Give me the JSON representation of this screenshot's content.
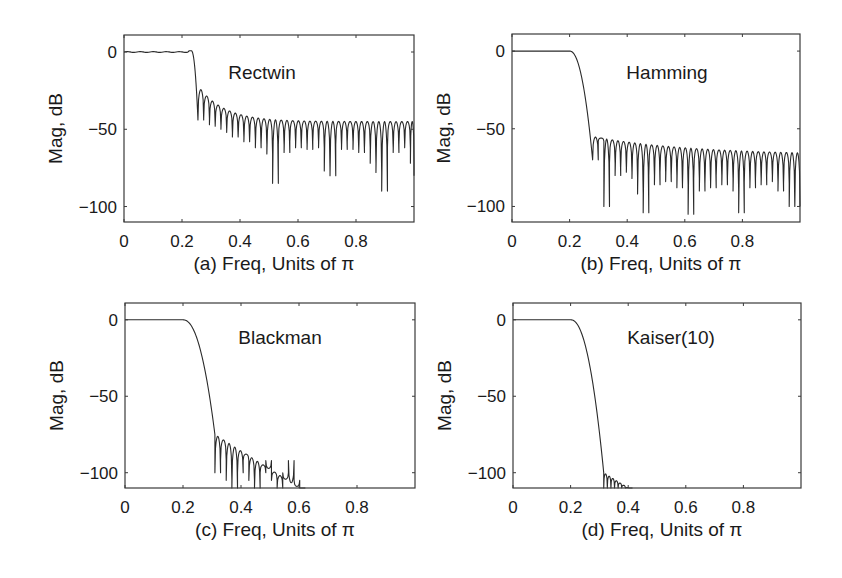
{
  "figure": {
    "background": "#ffffff",
    "line_color": "#2a2a2a",
    "axis_color": "#3a3a3a"
  },
  "chart_data": [
    {
      "type": "line",
      "panel": "a",
      "title": "Rectwin",
      "xlabel": "(a) Freq, Units of π",
      "ylabel": "Mag, dB",
      "xlim": [
        0,
        1
      ],
      "ylim": [
        -110,
        11
      ],
      "xticks": [
        0,
        0.2,
        0.4,
        0.6,
        0.8
      ],
      "xtick_labels": [
        "0",
        "0.2",
        "0.4",
        "0.6",
        "0.8"
      ],
      "yticks": [
        0,
        -50,
        -100
      ],
      "ytick_labels": [
        "0",
        "−50",
        "−100"
      ],
      "grid": false,
      "box": {
        "left": 124,
        "top": 35,
        "right": 414,
        "bottom": 222
      },
      "title_pos": {
        "x": 262,
        "y": 79
      },
      "passband": {
        "end": 0.23,
        "level": 0,
        "ripple_peak_x": 0.225,
        "ripple_peak": 0.8
      },
      "transition": {
        "start": 0.232,
        "end": 0.255
      },
      "stopband": {
        "start": 0.255,
        "first_sidelobe_db": -22,
        "asymptote_db": -45,
        "decay": 0.09,
        "lobe_width": 0.0198,
        "null_depth_db": [
          -44,
          -43,
          -47,
          -48,
          -50,
          -52,
          -55,
          -55,
          -58,
          -57,
          -62,
          -60,
          -66,
          -85,
          -60,
          -65,
          -58,
          -62,
          -60,
          -63,
          -58,
          -62,
          -77,
          -80,
          -60,
          -63,
          -58,
          -63,
          -65,
          -62,
          -72,
          -78,
          -90,
          -62,
          -65,
          -60,
          -62,
          -72,
          -80
        ],
        "series": [
          {
            "x": 0.0,
            "y": 0
          },
          {
            "x": 0.225,
            "y": 0.8
          },
          {
            "x": 0.255,
            "y": -44
          },
          {
            "x": 0.265,
            "y": -22
          },
          {
            "x": 0.3,
            "y": -30
          },
          {
            "x": 0.4,
            "y": -38
          },
          {
            "x": 0.48,
            "y": -85
          },
          {
            "x": 0.6,
            "y": -43
          },
          {
            "x": 0.8,
            "y": -45
          },
          {
            "x": 0.835,
            "y": -90
          },
          {
            "x": 1.0,
            "y": -80
          }
        ]
      }
    },
    {
      "type": "line",
      "panel": "b",
      "title": "Hamming",
      "xlabel": "(b) Freq, Units of π",
      "ylabel": "Mag, dB",
      "xlim": [
        0,
        1
      ],
      "ylim": [
        -110,
        11
      ],
      "xticks": [
        0,
        0.2,
        0.4,
        0.6,
        0.8
      ],
      "xtick_labels": [
        "0",
        "0.2",
        "0.4",
        "0.6",
        "0.8"
      ],
      "yticks": [
        0,
        -50,
        -100
      ],
      "ytick_labels": [
        "0",
        "−50",
        "−100"
      ],
      "grid": false,
      "box": {
        "left": 512,
        "top": 34,
        "right": 800,
        "bottom": 222
      },
      "title_pos": {
        "x": 667,
        "y": 79
      },
      "passband": {
        "end": 0.2,
        "level": 0
      },
      "transition": {
        "start": 0.2,
        "end": 0.28
      },
      "stopband": {
        "start": 0.28,
        "first_sidelobe_db": -55,
        "asymptote_db": -67,
        "decay": 0.35,
        "lobe_width": 0.0195,
        "null_depth_db": [
          -70,
          -58,
          -100,
          -72,
          -80,
          -75,
          -78,
          -82,
          -92,
          -104,
          -80,
          -86,
          -78,
          -84,
          -80,
          -88,
          -86,
          -105,
          -82,
          -90,
          -85,
          -88,
          -80,
          -86,
          -82,
          -90,
          -104,
          -84,
          -88,
          -82,
          -86,
          -80,
          -84,
          -90,
          -85,
          -100,
          -100
        ],
        "series": [
          {
            "x": 0.0,
            "y": 0
          },
          {
            "x": 0.2,
            "y": 0
          },
          {
            "x": 0.25,
            "y": -20
          },
          {
            "x": 0.28,
            "y": -70
          },
          {
            "x": 0.285,
            "y": -55
          },
          {
            "x": 0.33,
            "y": -100
          },
          {
            "x": 0.5,
            "y": -104
          },
          {
            "x": 0.67,
            "y": -105
          },
          {
            "x": 0.83,
            "y": -106
          },
          {
            "x": 1.0,
            "y": -67
          }
        ]
      }
    },
    {
      "type": "line",
      "panel": "c",
      "title": "Blackman",
      "xlabel": "(c) Freq, Units of π",
      "ylabel": "Mag, dB",
      "xlim": [
        0,
        1
      ],
      "ylim": [
        -110,
        11
      ],
      "xticks": [
        0,
        0.2,
        0.4,
        0.6,
        0.8
      ],
      "xtick_labels": [
        "0",
        "0.2",
        "0.4",
        "0.6",
        "0.8"
      ],
      "yticks": [
        0,
        -50,
        -100
      ],
      "ytick_labels": [
        "0",
        "−50",
        "−100"
      ],
      "grid": false,
      "box": {
        "left": 125,
        "top": 303,
        "right": 415,
        "bottom": 488
      },
      "title_pos": {
        "x": 280,
        "y": 344
      },
      "passband": {
        "end": 0.2,
        "level": 0
      },
      "transition": {
        "start": 0.2,
        "end": 0.31
      },
      "stopband": {
        "start": 0.31,
        "first_sidelobe_db": -75,
        "asymptote_db": -145,
        "decay": 0.0,
        "slope_db_per_unit": -120,
        "lobe_width": 0.0195,
        "null_depth_db": [
          -100,
          -92,
          -105,
          -110
        ],
        "series": [
          {
            "x": 0.0,
            "y": 0
          },
          {
            "x": 0.2,
            "y": 0
          },
          {
            "x": 0.3,
            "y": -75
          },
          {
            "x": 0.32,
            "y": -75
          },
          {
            "x": 0.4,
            "y": -90
          },
          {
            "x": 0.5,
            "y": -101
          },
          {
            "x": 0.6,
            "y": -110
          }
        ]
      }
    },
    {
      "type": "line",
      "panel": "d",
      "title": "Kaiser(10)",
      "xlabel": "(d) Freq, Units of π",
      "ylabel": "Mag, dB",
      "xlim": [
        0,
        1
      ],
      "ylim": [
        -110,
        11
      ],
      "xticks": [
        0,
        0.2,
        0.4,
        0.6,
        0.8
      ],
      "xtick_labels": [
        "0",
        "0.2",
        "0.4",
        "0.6",
        "0.8"
      ],
      "yticks": [
        0,
        -50,
        -100
      ],
      "ytick_labels": [
        "0",
        "−50",
        "−100"
      ],
      "grid": false,
      "box": {
        "left": 513,
        "top": 303,
        "right": 801,
        "bottom": 488
      },
      "title_pos": {
        "x": 671,
        "y": 344
      },
      "passband": {
        "end": 0.2,
        "level": 0
      },
      "transition": {
        "start": 0.2,
        "end": 0.315
      },
      "stopband": {
        "start": 0.315,
        "first_sidelobe_db": -100,
        "asymptote_db": -160,
        "decay": 0.0,
        "slope_db_per_unit": -120,
        "lobe_width": 0.0125,
        "null_depth_db": [
          -110,
          -110,
          -110,
          -110,
          -110,
          -110,
          -110,
          -110
        ],
        "series": [
          {
            "x": 0.0,
            "y": 0
          },
          {
            "x": 0.2,
            "y": 0
          },
          {
            "x": 0.3,
            "y": -80
          },
          {
            "x": 0.315,
            "y": -110
          },
          {
            "x": 0.32,
            "y": -100
          },
          {
            "x": 0.4,
            "y": -110
          }
        ]
      }
    }
  ]
}
